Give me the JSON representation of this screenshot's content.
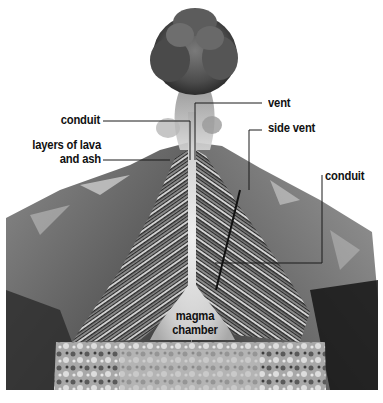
{
  "diagram": {
    "colors": {
      "background": "#ffffff",
      "label_text": "#111111",
      "leader_line": "#1a1a1a",
      "ash_cloud": "#5a5a5a",
      "mountain": "#6e6e6e",
      "magma": "#d8d8d8"
    },
    "labels": {
      "conduit_top": "conduit",
      "vent": "vent",
      "layers_line1": "layers of lava",
      "layers_line2": "and ash",
      "side_vent": "side vent",
      "conduit_right": "conduit",
      "magma_line1": "magma",
      "magma_line2": "chamber"
    }
  }
}
